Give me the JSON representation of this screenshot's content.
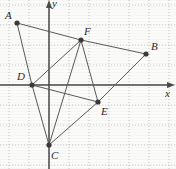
{
  "figure": {
    "type": "coordinate-plane-diagram",
    "background_color": "#fbfbf9",
    "grid": {
      "spacing_px": 20,
      "style": "dotted",
      "color": "#b9b9b9",
      "visible": true
    },
    "axes": {
      "origin_px": {
        "x": 49,
        "y": 85
      },
      "x_axis": {
        "label": "x",
        "color": "#4a4a4a",
        "arrow": true
      },
      "y_axis": {
        "label": "y",
        "color": "#4a4a4a",
        "arrow": true
      }
    },
    "points": [
      {
        "id": "A",
        "label": "A",
        "px": {
          "x": 17,
          "y": 23
        },
        "label_px": {
          "x": 5,
          "y": 10
        }
      },
      {
        "id": "B",
        "label": "B",
        "px": {
          "x": 146,
          "y": 54
        },
        "label_px": {
          "x": 151,
          "y": 41
        }
      },
      {
        "id": "C",
        "label": "C",
        "px": {
          "x": 49,
          "y": 145
        },
        "label_px": {
          "x": 51,
          "y": 150
        }
      },
      {
        "id": "D",
        "label": "D",
        "px": {
          "x": 32,
          "y": 85
        },
        "label_px": {
          "x": 17,
          "y": 71
        }
      },
      {
        "id": "E",
        "label": "E",
        "px": {
          "x": 98,
          "y": 102
        },
        "label_px": {
          "x": 101,
          "y": 106
        }
      },
      {
        "id": "F",
        "label": "F",
        "px": {
          "x": 81,
          "y": 40
        },
        "label_px": {
          "x": 84,
          "y": 26
        }
      }
    ],
    "segments": [
      {
        "from": "A",
        "to": "F"
      },
      {
        "from": "F",
        "to": "B"
      },
      {
        "from": "A",
        "to": "D"
      },
      {
        "from": "D",
        "to": "F"
      },
      {
        "from": "D",
        "to": "C"
      },
      {
        "from": "D",
        "to": "E"
      },
      {
        "from": "F",
        "to": "E"
      },
      {
        "from": "C",
        "to": "E"
      },
      {
        "from": "E",
        "to": "B"
      },
      {
        "from": "C",
        "to": "F"
      }
    ],
    "line_color": "#5a5a5a",
    "point_color": "#3a3a3a"
  },
  "chart_data": {
    "type": "scatter",
    "title": "",
    "xlabel": "x",
    "ylabel": "y",
    "grid": true,
    "legend": "none",
    "unit_px": 20,
    "origin_px": {
      "x": 49,
      "y": 85
    },
    "xlim": [
      -2.45,
      6.35
    ],
    "ylim": [
      -4.2,
      4.25
    ],
    "categories": [
      "A",
      "B",
      "C",
      "D",
      "E",
      "F"
    ],
    "points": [
      {
        "label": "A",
        "x": -1.6,
        "y": 3.1
      },
      {
        "label": "B",
        "x": 4.85,
        "y": 1.55
      },
      {
        "label": "C",
        "x": 0.0,
        "y": -3.0
      },
      {
        "label": "D",
        "x": -0.85,
        "y": 0.0
      },
      {
        "label": "E",
        "x": 2.45,
        "y": -0.85
      },
      {
        "label": "F",
        "x": 1.6,
        "y": 2.25
      }
    ],
    "edges": [
      [
        "A",
        "F"
      ],
      [
        "F",
        "B"
      ],
      [
        "A",
        "D"
      ],
      [
        "D",
        "F"
      ],
      [
        "D",
        "C"
      ],
      [
        "D",
        "E"
      ],
      [
        "F",
        "E"
      ],
      [
        "C",
        "E"
      ],
      [
        "E",
        "B"
      ],
      [
        "C",
        "F"
      ]
    ]
  }
}
